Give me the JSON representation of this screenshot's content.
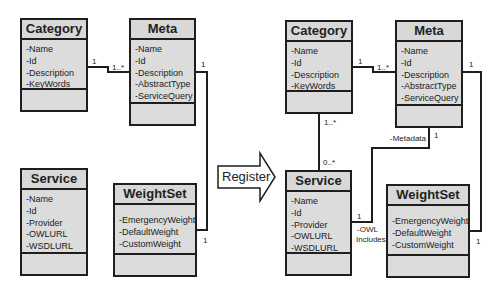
{
  "left_diagram": {
    "category": {
      "title": "Category",
      "attributes": [
        "-Name",
        "-Id",
        "-Description",
        "-KeyWords"
      ]
    },
    "meta": {
      "title": "Meta",
      "attributes": [
        "-Name",
        "-Id",
        "-Description",
        "-AbstractType",
        "-ServiceQuery"
      ]
    },
    "service": {
      "title": "Service",
      "attributes": [
        "-Name",
        "-Id",
        "-Provider",
        "-OWLURL",
        "-WSDLURL"
      ]
    },
    "weightset": {
      "title": "WeightSet",
      "attributes": [
        "-EmergencyWeight",
        "-DefaultWeight",
        "-CustomWeight"
      ]
    },
    "labels": {
      "category_meta_cat_end": "1",
      "category_meta_meta_end": "1..*",
      "meta_weightset_meta_end": "1",
      "meta_weightset_ws_end": "1"
    }
  },
  "arrow": {
    "label": "Register"
  },
  "right_diagram": {
    "category": {
      "title": "Category",
      "attributes": [
        "-Name",
        "-Id",
        "-Description",
        "-KeyWords"
      ]
    },
    "meta": {
      "title": "Meta",
      "attributes": [
        "-Name",
        "-Id",
        "-Description",
        "-AbstractType",
        "-ServiceQuery"
      ]
    },
    "service": {
      "title": "Service",
      "attributes": [
        "-Name",
        "-Id",
        "-Provider",
        "-OWLURL",
        "-WSDLURL"
      ]
    },
    "weightset": {
      "title": "WeightSet",
      "attributes": [
        "-EmergencyWeight",
        "-DefaultWeight",
        "-CustomWeight"
      ]
    },
    "labels": {
      "category_meta_cat_end": "1",
      "category_meta_meta_end": "1..*",
      "category_service_cat_end": "1..*",
      "category_service_svc_end": "0..*",
      "meta_service_role": "-Metadata",
      "meta_service_meta_end": "1",
      "meta_service_svc_end": "1",
      "service_role_line1": "-OWL",
      "service_role_line2": "Includes",
      "meta_weightset_meta_end": "1",
      "meta_weightset_ws_end": "1"
    }
  }
}
